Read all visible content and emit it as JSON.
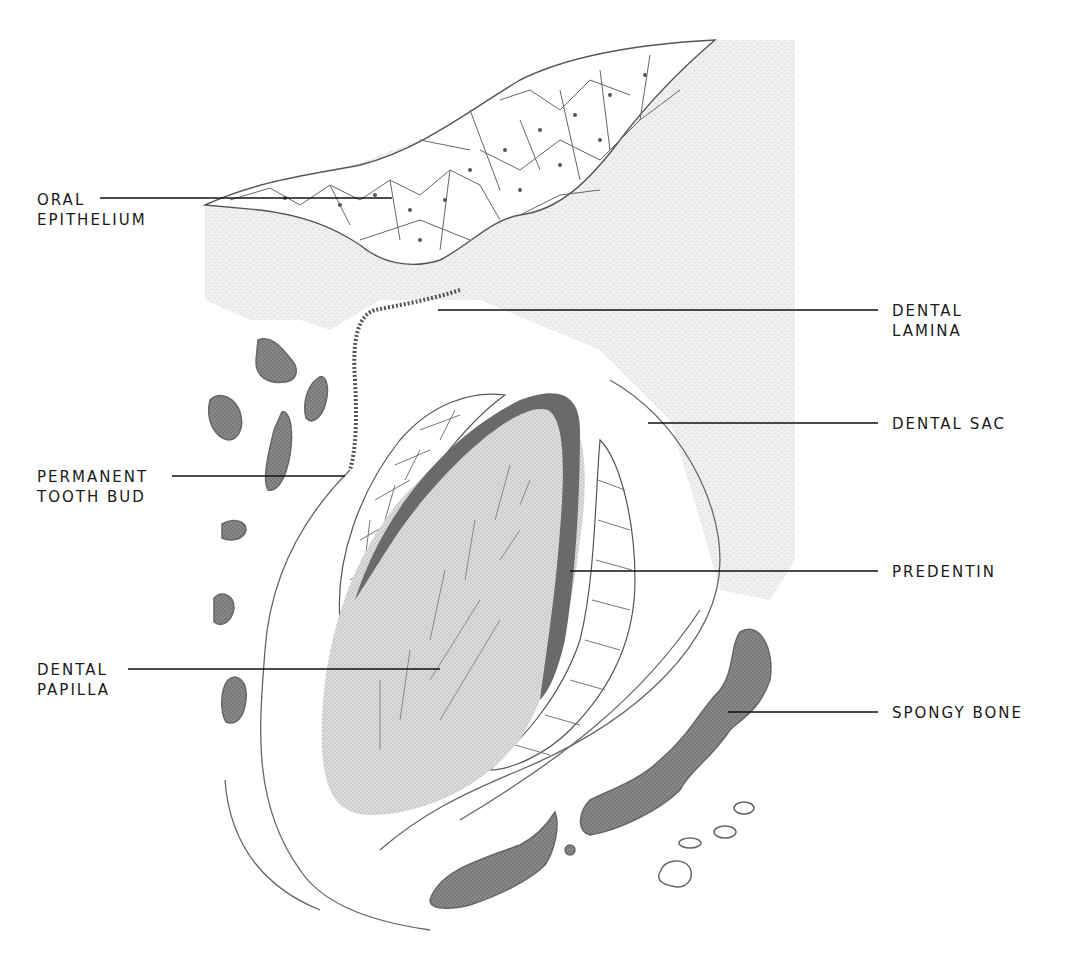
{
  "figure": {
    "colors": {
      "background": "#ffffff",
      "connective_tissue_stipple": "#ececec",
      "bone": "#6e6e6e",
      "predentin": "#6a6a6a",
      "papilla": "#d8d8d8",
      "cell_outline": "#555555",
      "leader_line": "#111111"
    }
  },
  "labels": {
    "oral_epithelium": {
      "line1": "ORAL",
      "line2": "EPITHELIUM"
    },
    "dental_lamina": {
      "line1": "DENTAL",
      "line2": "LAMINA"
    },
    "dental_sac": {
      "line1": "DENTAL SAC"
    },
    "permanent_tooth_bud": {
      "line1": "PERMANENT",
      "line2": "TOOTH BUD"
    },
    "predentin": {
      "line1": "PREDENTIN"
    },
    "dental_papilla": {
      "line1": "DENTAL",
      "line2": "PAPILLA"
    },
    "spongy_bone": {
      "line1": "SPONGY BONE"
    }
  }
}
